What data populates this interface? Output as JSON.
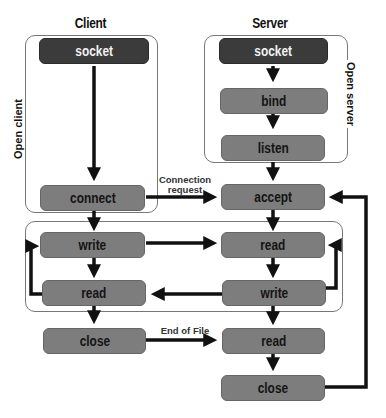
{
  "diagram": {
    "headers": {
      "client": "Client",
      "server": "Server"
    },
    "groups": {
      "open_client": "Open client",
      "open_server": "Open server"
    },
    "client": {
      "socket": "socket",
      "connect": "connect",
      "write": "write",
      "read": "read",
      "close": "close"
    },
    "server": {
      "socket": "socket",
      "bind": "bind",
      "listen": "listen",
      "accept": "accept",
      "read": "read",
      "write": "write",
      "read_eof": "read",
      "close": "close"
    },
    "edge_labels": {
      "connection_request": "Connection\nrequest",
      "end_of_file": "End of File"
    },
    "colors": {
      "dark_box": "#3b3b3b",
      "box": "#7d7d7d",
      "arrow": "#111111"
    }
  }
}
